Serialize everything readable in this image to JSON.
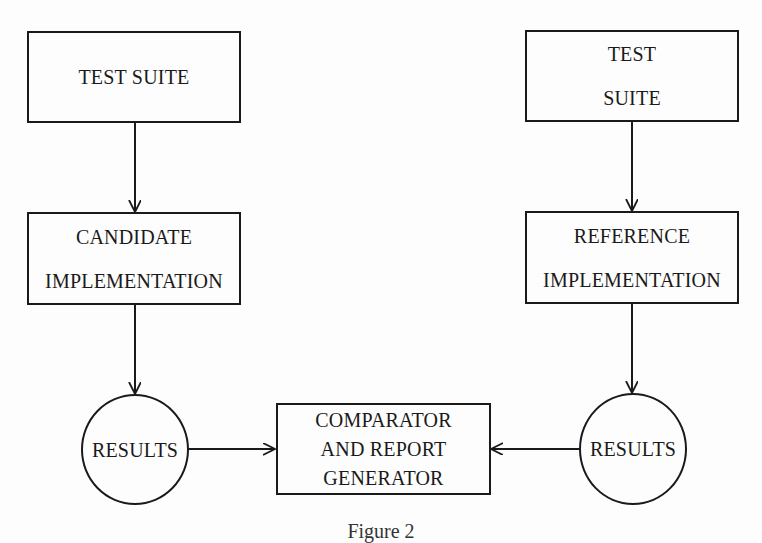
{
  "diagram": {
    "nodes": {
      "test_suite_left": {
        "lines": [
          "TEST SUITE"
        ]
      },
      "test_suite_right": {
        "lines": [
          "TEST",
          "SUITE"
        ]
      },
      "candidate_impl": {
        "lines": [
          "CANDIDATE",
          "IMPLEMENTATION"
        ]
      },
      "reference_impl": {
        "lines": [
          "REFERENCE",
          "IMPLEMENTATION"
        ]
      },
      "results_left": {
        "lines": [
          "RESULTS"
        ]
      },
      "results_right": {
        "lines": [
          "RESULTS"
        ]
      },
      "comparator": {
        "lines": [
          "COMPARATOR",
          "AND REPORT",
          "GENERATOR"
        ]
      }
    },
    "edges": [
      {
        "from": "test_suite_left",
        "to": "candidate_impl"
      },
      {
        "from": "candidate_impl",
        "to": "results_left"
      },
      {
        "from": "results_left",
        "to": "comparator"
      },
      {
        "from": "test_suite_right",
        "to": "reference_impl"
      },
      {
        "from": "reference_impl",
        "to": "results_right"
      },
      {
        "from": "results_right",
        "to": "comparator"
      }
    ],
    "caption": "Figure 2"
  }
}
